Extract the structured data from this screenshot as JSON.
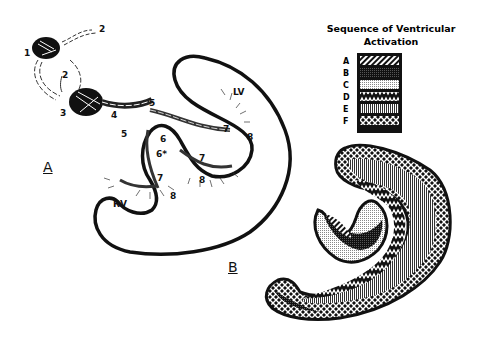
{
  "legend": {
    "title_line1": "Sequence of Ventricular",
    "title_line2": "Activation",
    "items": [
      {
        "letter": "A",
        "pattern": "diagonal-stripes"
      },
      {
        "letter": "B",
        "pattern": "dense-dark-dots"
      },
      {
        "letter": "C",
        "pattern": "light-dots"
      },
      {
        "letter": "D",
        "pattern": "zigzag-weave"
      },
      {
        "letter": "E",
        "pattern": "vertical-stripes"
      },
      {
        "letter": "F",
        "pattern": "crosshatch"
      }
    ]
  },
  "panel_a": {
    "label": "A",
    "chambers": {
      "lv": "LV",
      "rv": "RV"
    },
    "sequence_numbers": [
      "1",
      "2",
      "2",
      "3",
      "4",
      "5",
      "5",
      "6",
      "6*",
      "7",
      "7",
      "7",
      "8",
      "8",
      "8"
    ]
  },
  "panel_b": {
    "label": "B"
  }
}
